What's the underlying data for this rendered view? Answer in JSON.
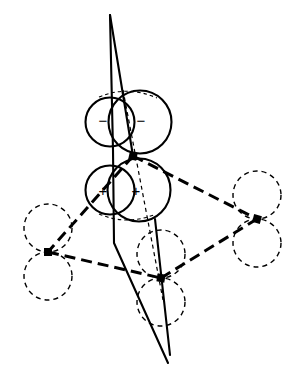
{
  "figure": {
    "width": 298,
    "height": 379,
    "background_color": "#ffffff",
    "line_color": "#000000"
  },
  "orbital": {
    "negative_lobe": {
      "sign_symbol": "−",
      "labels": [
        {
          "text": "−",
          "x": 103,
          "y": 120
        },
        {
          "text": "−",
          "x": 141,
          "y": 120
        }
      ],
      "circles": [
        {
          "cx": 110,
          "cy": 122,
          "r": 24.5
        },
        {
          "cx": 140,
          "cy": 122,
          "r": 31.5
        }
      ]
    },
    "positive_lobe": {
      "sign_symbol": "+",
      "labels": [
        {
          "text": "+",
          "x": 103,
          "y": 190
        },
        {
          "text": "+",
          "x": 136,
          "y": 190
        }
      ],
      "circles": [
        {
          "cx": 110,
          "cy": 190,
          "r": 24.5
        },
        {
          "cx": 139,
          "cy": 190,
          "r": 31.5
        }
      ]
    },
    "node_point": {
      "x": 133,
      "y": 156
    }
  },
  "atoms": [
    {
      "name": "central-atom",
      "x": 133,
      "y": 156,
      "marker": "filled-square",
      "size": 7
    },
    {
      "name": "left-atom",
      "x": 48,
      "y": 252,
      "marker": "filled-square",
      "size": 7
    },
    {
      "name": "right-atom",
      "x": 257,
      "y": 219,
      "marker": "filled-square",
      "size": 7
    },
    {
      "name": "bottom-atom",
      "x": 161,
      "y": 278,
      "marker": "filled-square",
      "size": 7
    }
  ],
  "neighbour_orbitals": [
    {
      "atom": "left-atom",
      "cx": 48,
      "cy": 228,
      "r": 24
    },
    {
      "atom": "left-atom",
      "cx": 48,
      "cy": 276,
      "r": 24
    },
    {
      "atom": "right-atom",
      "cx": 257,
      "cy": 195,
      "r": 24
    },
    {
      "atom": "right-atom",
      "cx": 257,
      "cy": 243,
      "r": 24
    },
    {
      "atom": "bottom-atom",
      "cx": 161,
      "cy": 254,
      "r": 24
    },
    {
      "atom": "bottom-atom",
      "cx": 161,
      "cy": 302,
      "r": 24
    }
  ],
  "bonds": [
    {
      "name": "bond-center-left",
      "from": "central-atom",
      "to": "left-atom",
      "style": "dashed-thick"
    },
    {
      "name": "bond-center-right",
      "from": "central-atom",
      "to": "right-atom",
      "style": "dashed-thick"
    },
    {
      "name": "bond-left-bottom",
      "from": "left-atom",
      "to": "bottom-atom",
      "style": "dashed-thick"
    },
    {
      "name": "bond-bottom-right",
      "from": "bottom-atom",
      "to": "right-atom",
      "style": "dashed-thick"
    }
  ],
  "unit_cell": {
    "name": "unit-cell-outline",
    "style": "solid",
    "top_apex": {
      "x": 110,
      "y": 15
    },
    "bottom_apex": {
      "x": 168,
      "y": 363
    },
    "left_bend": {
      "x": 114,
      "y": 243
    },
    "right_vertical_top": {
      "x": 170,
      "y": 220
    },
    "right_vertical_bottom": {
      "x": 170,
      "y": 355
    }
  },
  "axis_line": {
    "name": "orbital-axis",
    "style": "dashed-thin",
    "start": {
      "x": 123,
      "y": 90
    },
    "end": {
      "x": 163,
      "y": 300
    }
  },
  "hidden_arcs": [
    {
      "name": "top-hidden-arc",
      "style": "dashed-thin"
    },
    {
      "name": "bottom-hidden-arc",
      "style": "dashed-thin"
    }
  ]
}
